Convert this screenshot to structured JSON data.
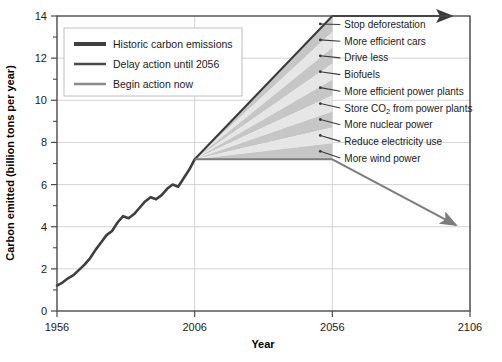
{
  "chart_data": {
    "type": "line",
    "title": "",
    "xlabel": "Year",
    "ylabel": "Carbon emitted (billion tons per year)",
    "xlim": [
      1956,
      2106
    ],
    "ylim": [
      0,
      14
    ],
    "xticks": [
      1956,
      2006,
      2056,
      2106
    ],
    "yticks": [
      0,
      2,
      4,
      6,
      8,
      10,
      12,
      14
    ],
    "yticks_minor": [
      1,
      3,
      5,
      7,
      9,
      11,
      13
    ],
    "grid": true,
    "legend_position": "upper-left-inside",
    "series": [
      {
        "name": "Historic carbon emissions",
        "color": "#3f3f3f",
        "width": 2.6,
        "x": [
          1956,
          1958,
          1960,
          1962,
          1964,
          1966,
          1968,
          1970,
          1972,
          1974,
          1976,
          1978,
          1980,
          1982,
          1984,
          1986,
          1988,
          1990,
          1992,
          1994,
          1996,
          1998,
          2000,
          2002,
          2004,
          2006
        ],
        "y": [
          1.2,
          1.35,
          1.55,
          1.7,
          1.95,
          2.2,
          2.5,
          2.9,
          3.25,
          3.6,
          3.8,
          4.2,
          4.5,
          4.4,
          4.6,
          4.9,
          5.2,
          5.4,
          5.3,
          5.5,
          5.8,
          6.0,
          5.9,
          6.3,
          6.7,
          7.2
        ]
      },
      {
        "name": "Delay action until 2056",
        "color": "#3a3a3a",
        "width": 2.0,
        "x": [
          2006,
          2056,
          2106
        ],
        "y": [
          7.2,
          14.0,
          14.0
        ]
      },
      {
        "name": "Begin action now",
        "color": "#7c7c7c",
        "width": 2.0,
        "x": [
          2006,
          2056,
          2106
        ],
        "y": [
          7.2,
          7.2,
          3.7
        ]
      }
    ],
    "wedges": {
      "apex_year": 2006,
      "apex_value": 7.2,
      "end_year": 2056,
      "top_value": 14.0,
      "base_value": 7.2,
      "labels": [
        "Stop deforestation",
        "More efficient cars",
        "Drive less",
        "Biofuels",
        "More efficient power plants",
        "Store CO2 from power plants",
        "More nuclear power",
        "Reduce electricity use",
        "More wind power"
      ],
      "label_html": [
        "Stop deforestation",
        "More efficient cars",
        "Drive less",
        "Biofuels",
        "More efficient power plants",
        "Store CO<sub>2</sub> from power plants",
        "More nuclear power",
        "Reduce electricity use",
        "More wind power"
      ],
      "fill_light": "#e6e6e6",
      "fill_dark": "#c6c6c6"
    }
  },
  "legend": {
    "items": [
      {
        "label": "Historic carbon emissions",
        "color": "#3f3f3f",
        "thickness": 4
      },
      {
        "label": "Delay action until 2056",
        "color": "#4a4a4a",
        "thickness": 2.5
      },
      {
        "label": "Begin action now",
        "color": "#8a8a8a",
        "thickness": 2.5
      }
    ]
  },
  "axes": {
    "x_title": "Year",
    "y_title": "Carbon emitted (billion tons per year)",
    "x_tick_labels": [
      "1956",
      "2006",
      "2056",
      "2106"
    ],
    "y_tick_labels": [
      "0",
      "2",
      "4",
      "6",
      "8",
      "10",
      "12",
      "14"
    ]
  },
  "colors": {
    "frame": "#4a4a4a",
    "grid": "#cfcfcf",
    "text": "#1a1a1a"
  }
}
